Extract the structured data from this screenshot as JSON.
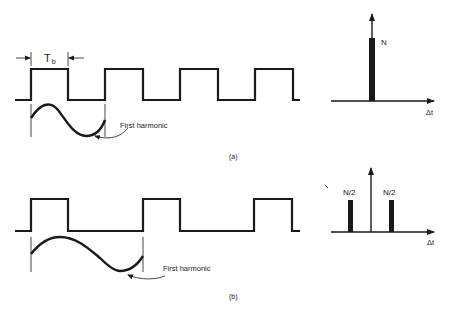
{
  "figure": {
    "panel_a": {
      "caption": "(a)",
      "period_label_main": "T",
      "period_label_sub": "b",
      "harmonic_label": "First harmonic",
      "spectrum": {
        "bar_label": "N",
        "axis_label": "Δt"
      }
    },
    "panel_b": {
      "caption": "(b)",
      "harmonic_label": "First harmonic",
      "spectrum": {
        "left_bar_label": "N/2",
        "right_bar_label": "N/2",
        "axis_label": "Δt"
      }
    }
  }
}
